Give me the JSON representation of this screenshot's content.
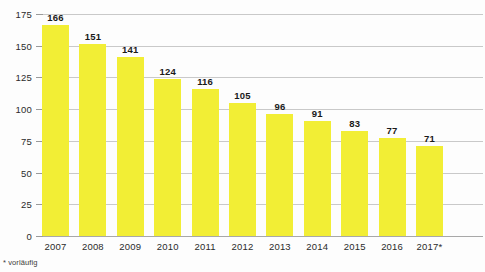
{
  "chart_data": {
    "type": "bar",
    "title": "",
    "xlabel": "",
    "ylabel": "",
    "categories": [
      "2007",
      "2008",
      "2009",
      "2010",
      "2011",
      "2012",
      "2013",
      "2014",
      "2015",
      "2016",
      "2017*"
    ],
    "values": [
      166,
      151,
      141,
      124,
      116,
      105,
      96,
      91,
      83,
      77,
      71
    ],
    "value_labels": [
      "166",
      "151",
      "141",
      "124",
      "116",
      "105",
      "96",
      "91",
      "83",
      "77",
      "71"
    ],
    "ylim": [
      0,
      175
    ],
    "yticks": [
      0,
      25,
      50,
      75,
      100,
      125,
      150,
      175
    ],
    "ytick_labels": [
      "0",
      "25",
      "50",
      "75",
      "100",
      "125",
      "150",
      "175"
    ],
    "grid": true,
    "legend": "none",
    "footnote": "* vorläufig",
    "bar_color": "#f2ee35",
    "grid_color": "#c9c9c9",
    "axis_color": "#a8a8a8",
    "text_color": "#2b2b2b",
    "background": "#fdfdfd"
  }
}
